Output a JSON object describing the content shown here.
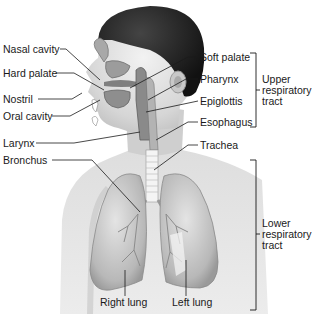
{
  "diagram": {
    "left_labels": [
      {
        "id": "nasal_cavity",
        "text": "Nasal cavity",
        "x": 3,
        "y": 44
      },
      {
        "id": "hard_palate",
        "text": "Hard palate",
        "x": 3,
        "y": 68
      },
      {
        "id": "nostril",
        "text": "Nostril",
        "x": 3,
        "y": 94
      },
      {
        "id": "oral_cavity",
        "text": "Oral cavity",
        "x": 3,
        "y": 111
      },
      {
        "id": "larynx",
        "text": "Larynx",
        "x": 3,
        "y": 138
      },
      {
        "id": "bronchus",
        "text": "Bronchus",
        "x": 3,
        "y": 155
      }
    ],
    "right_labels": [
      {
        "id": "soft_palate",
        "text": "Soft palate",
        "x": 200,
        "y": 52
      },
      {
        "id": "pharynx",
        "text": "Pharynx",
        "x": 200,
        "y": 74
      },
      {
        "id": "epiglottis",
        "text": "Epiglottis",
        "x": 200,
        "y": 96
      },
      {
        "id": "esophagus",
        "text": "Esophagus",
        "x": 200,
        "y": 117
      },
      {
        "id": "trachea",
        "text": "Trachea",
        "x": 200,
        "y": 140
      }
    ],
    "bottom_labels": [
      {
        "id": "right_lung",
        "text": "Right lung",
        "x": 100,
        "y": 296
      },
      {
        "id": "left_lung",
        "text": "Left lung",
        "x": 172,
        "y": 296
      }
    ],
    "groups": {
      "upper": {
        "line1": "Upper",
        "line2": "respiratory",
        "line3": "tract"
      },
      "lower": {
        "line1": "Lower",
        "line2": "respiratory",
        "line3": "tract"
      }
    }
  }
}
